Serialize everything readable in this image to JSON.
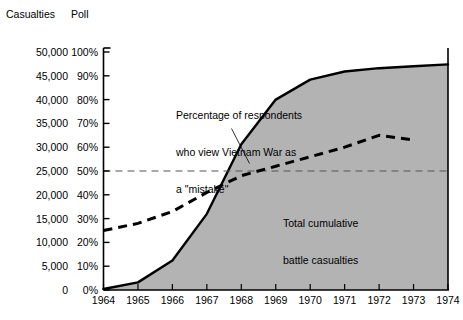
{
  "figure": {
    "casualties_axis_title": "Casualties",
    "poll_axis_title": "Poll"
  },
  "annotations": {
    "poll_line": "Percentage of respondents\nwho view Vietnam War as\na \"mistake\"",
    "poll_line_l1": "Percentage of respondents",
    "poll_line_l2": "who view Vietnam War as",
    "poll_line_l3": "a \"mistake\"",
    "area_l1": "Total cumulative",
    "area_l2": "battle casualties"
  },
  "colors": {
    "area_fill": "#b3b3b3",
    "area_stroke": "#000000",
    "poll_line": "#000000",
    "reference_line": "#555555",
    "axis": "#000000",
    "background": "#ffffff"
  },
  "chart_data": {
    "type": "area",
    "title": "",
    "subtitle": "",
    "xlabel": "",
    "ylabel": "Casualties",
    "y2label": "Poll",
    "grid": false,
    "legend_position": "none",
    "x": [
      1964,
      1965,
      1966,
      1967,
      1968,
      1969,
      1970,
      1971,
      1972,
      1973,
      1974
    ],
    "xtick_labels": [
      "1964",
      "1965",
      "1966",
      "1967",
      "1968",
      "1969",
      "1970",
      "1971",
      "1972",
      "1973",
      "1974"
    ],
    "xlim": [
      1964,
      1974
    ],
    "ylim": [
      0,
      50000
    ],
    "ytick_values": [
      0,
      5000,
      10000,
      15000,
      20000,
      25000,
      30000,
      35000,
      40000,
      45000,
      50000
    ],
    "ytick_labels": [
      "0",
      "5,000",
      "10,000",
      "15,000",
      "20,000",
      "25,000",
      "30,000",
      "35,000",
      "40,000",
      "45,000",
      "50,000"
    ],
    "y2lim": [
      0,
      100
    ],
    "y2tick_values": [
      0,
      10,
      20,
      30,
      40,
      50,
      60,
      70,
      80,
      90,
      100
    ],
    "y2tick_labels": [
      "0%",
      "10%",
      "20%",
      "30%",
      "40%",
      "50%",
      "60%",
      "70%",
      "80%",
      "90%",
      "100%"
    ],
    "reference_line": {
      "axis": "poll",
      "value": 50,
      "style": "dashed",
      "label": ""
    },
    "series": [
      {
        "name": "Total cumulative battle casualties",
        "type": "area",
        "axis": "casualties",
        "fill": "#b3b3b3",
        "stroke": "#000000",
        "values": [
          200,
          1600,
          6200,
          16000,
          30600,
          40000,
          44200,
          45900,
          46600,
          47000,
          47400
        ]
      },
      {
        "name": "Percentage of respondents who view Vietnam War as a \"mistake\"",
        "type": "line",
        "axis": "poll",
        "style": "dashed",
        "stroke": "#000000",
        "values": [
          25,
          28,
          33,
          41,
          48,
          52,
          56,
          60,
          65,
          63,
          null
        ]
      }
    ]
  }
}
